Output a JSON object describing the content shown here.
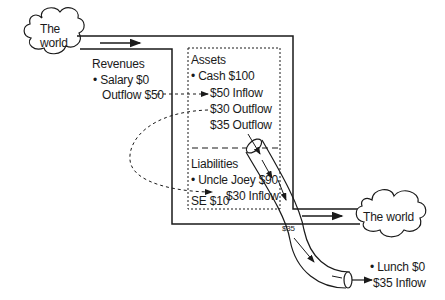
{
  "diagram": {
    "left_world": {
      "line1": "The",
      "line2": "world"
    },
    "right_world": {
      "label": "The world"
    },
    "revenues": {
      "title": "Revenues",
      "item": "• Salary  $0",
      "outflow": "Outflow $50"
    },
    "assets": {
      "title": "Assets",
      "item": "• Cash $100",
      "inflow": "$50 Inflow",
      "outflow30": "$30 Outflow",
      "outflow35": "$35 Outflow"
    },
    "liabilities": {
      "title": "Liabilities",
      "item": "• Uncle Joey $90",
      "inflow": "$30 Inflow",
      "se": "SE $10"
    },
    "pipe": {
      "label": "$35"
    },
    "expense": {
      "item": "• Lunch $0",
      "inflow": "$35 Inflow"
    },
    "colors": {
      "stroke": "#1a1a1a",
      "background": "#ffffff"
    }
  }
}
